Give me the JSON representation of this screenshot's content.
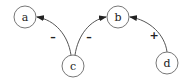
{
  "diagram": {
    "type": "signed-directed-graph",
    "nodes": [
      {
        "id": "a",
        "label": "a",
        "x": 25,
        "y": 17
      },
      {
        "id": "b",
        "label": "b",
        "x": 118,
        "y": 17
      },
      {
        "id": "c",
        "label": "c",
        "x": 73,
        "y": 66
      },
      {
        "id": "d",
        "label": "d",
        "x": 167,
        "y": 63
      }
    ],
    "edges": [
      {
        "from": "c",
        "to": "a",
        "sign": "–"
      },
      {
        "from": "c",
        "to": "b",
        "sign": "–"
      },
      {
        "from": "d",
        "to": "b",
        "sign": "+"
      }
    ],
    "colors": {
      "stroke": "#555555",
      "text": "#222222",
      "background": "#ffffff"
    }
  }
}
